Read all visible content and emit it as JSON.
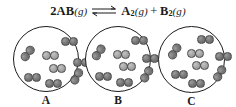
{
  "equation": {
    "coefficient": "2",
    "reactant_species": "AB",
    "reactant_state": "(g)",
    "arrow_symbol": "equilibrium-double-harpoon",
    "product1_species": "A",
    "product1_subscript": "2",
    "product1_state": "(g)",
    "plus_sign": "+",
    "product2_species": "B",
    "product2_subscript": "2",
    "product2_state": "(g)",
    "full_text": "2AB(g) ⇌ A2(g) + B2(g)"
  },
  "colors": {
    "atom_dark": "#707070",
    "atom_light": "#a8a8a8",
    "circle_stroke": "#1c1c1c",
    "text": "#1a1a1a",
    "background": "#ffffff"
  },
  "chart_data": {
    "type": "diagram",
    "categories": [
      "A",
      "B",
      "C"
    ],
    "values": [
      8,
      8,
      8
    ],
    "ylabel": "molecule count",
    "panels": [
      {
        "label": "A",
        "molecule_count": 8,
        "molecules": [
          {
            "x": 47,
            "y": 10,
            "rot": 0,
            "left": "dark",
            "right": "dark"
          },
          {
            "x": 5,
            "y": 22,
            "rot": -52,
            "left": "dark",
            "right": "dark"
          },
          {
            "x": 28,
            "y": 24,
            "rot": 0,
            "left": "light",
            "right": "light"
          },
          {
            "x": 59,
            "y": 31,
            "rot": 0,
            "left": "dark",
            "right": "dark"
          },
          {
            "x": 35,
            "y": 37,
            "rot": 0,
            "left": "light",
            "right": "light"
          },
          {
            "x": 10,
            "y": 46,
            "rot": 0,
            "left": "dark",
            "right": "dark"
          },
          {
            "x": 54,
            "y": 45,
            "rot": -62,
            "left": "dark",
            "right": "dark"
          },
          {
            "x": 31,
            "y": 52,
            "rot": 0,
            "left": "dark",
            "right": "dark"
          }
        ]
      },
      {
        "label": "B",
        "molecule_count": 8,
        "molecules": [
          {
            "x": 45,
            "y": 9,
            "rot": 0,
            "left": "dark",
            "right": "dark"
          },
          {
            "x": 4,
            "y": 21,
            "rot": -55,
            "left": "dark",
            "right": "dark"
          },
          {
            "x": 27,
            "y": 23,
            "rot": 0,
            "left": "light",
            "right": "light"
          },
          {
            "x": 56,
            "y": 27,
            "rot": 0,
            "left": "dark",
            "right": "dark"
          },
          {
            "x": 33,
            "y": 35,
            "rot": 0,
            "left": "light",
            "right": "light"
          },
          {
            "x": 9,
            "y": 45,
            "rot": 0,
            "left": "dark",
            "right": "dark"
          },
          {
            "x": 52,
            "y": 43,
            "rot": -60,
            "left": "dark",
            "right": "dark"
          },
          {
            "x": 30,
            "y": 51,
            "rot": 0,
            "left": "dark",
            "right": "dark"
          }
        ]
      },
      {
        "label": "C",
        "molecule_count": 8,
        "molecules": [
          {
            "x": 38,
            "y": 8,
            "rot": 0,
            "left": "dark",
            "right": "dark"
          },
          {
            "x": 7,
            "y": 20,
            "rot": -58,
            "left": "dark",
            "right": "dark"
          },
          {
            "x": 28,
            "y": 22,
            "rot": 0,
            "left": "light",
            "right": "light"
          },
          {
            "x": 56,
            "y": 25,
            "rot": 0,
            "left": "dark",
            "right": "dark"
          },
          {
            "x": 33,
            "y": 34,
            "rot": 0,
            "left": "light",
            "right": "light"
          },
          {
            "x": 12,
            "y": 43,
            "rot": 0,
            "left": "dark",
            "right": "dark"
          },
          {
            "x": 52,
            "y": 42,
            "rot": -60,
            "left": "dark",
            "right": "dark"
          },
          {
            "x": 29,
            "y": 52,
            "rot": 0,
            "left": "dark",
            "right": "dark"
          }
        ]
      }
    ]
  }
}
